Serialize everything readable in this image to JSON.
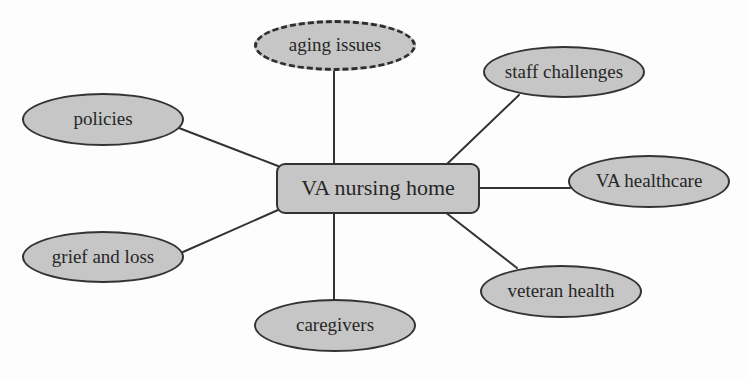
{
  "diagram": {
    "type": "concept-map",
    "center": {
      "id": "va-nursing-home",
      "label": "VA nursing home",
      "shape": "rounded-rectangle"
    },
    "nodes": [
      {
        "id": "aging-issues",
        "label": "aging issues",
        "shape": "ellipse",
        "border": "dashed"
      },
      {
        "id": "staff-challenges",
        "label": "staff challenges",
        "shape": "ellipse",
        "border": "solid"
      },
      {
        "id": "policies",
        "label": "policies",
        "shape": "ellipse",
        "border": "solid"
      },
      {
        "id": "va-healthcare",
        "label": "VA healthcare",
        "shape": "ellipse",
        "border": "solid"
      },
      {
        "id": "grief-and-loss",
        "label": "grief and loss",
        "shape": "ellipse",
        "border": "solid"
      },
      {
        "id": "veteran-health",
        "label": "veteran health",
        "shape": "ellipse",
        "border": "solid"
      },
      {
        "id": "caregivers",
        "label": "caregivers",
        "shape": "ellipse",
        "border": "solid"
      }
    ],
    "edges": [
      {
        "from": "va-nursing-home",
        "to": "aging-issues"
      },
      {
        "from": "va-nursing-home",
        "to": "staff-challenges"
      },
      {
        "from": "va-nursing-home",
        "to": "policies"
      },
      {
        "from": "va-nursing-home",
        "to": "va-healthcare"
      },
      {
        "from": "va-nursing-home",
        "to": "grief-and-loss"
      },
      {
        "from": "va-nursing-home",
        "to": "veteran-health"
      },
      {
        "from": "va-nursing-home",
        "to": "caregivers"
      }
    ],
    "colors": {
      "node_fill": "#c6c6c6",
      "node_border": "#333333",
      "edge": "#333333",
      "text": "#262626"
    }
  }
}
